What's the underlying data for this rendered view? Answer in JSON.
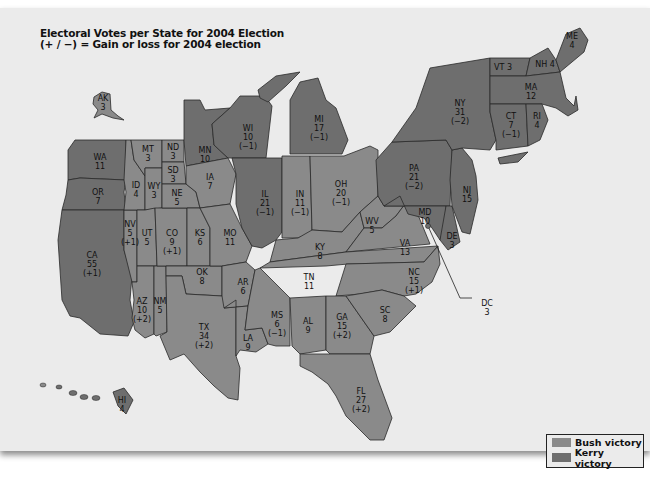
{
  "title": {
    "line1": "Electoral Votes per State for 2004 Election",
    "line2": "(+ / −) = Gain or loss for 2004 election"
  },
  "colors": {
    "bush": "#8a8a8a",
    "kerry": "#6e6e6e",
    "background": "#ebebeb"
  },
  "legend": {
    "items": [
      {
        "label": "Bush victory",
        "color": "#8a8a8a"
      },
      {
        "label": "Kerry victory",
        "color": "#6e6e6e"
      }
    ]
  },
  "states": {
    "AK": {
      "votes": "3",
      "change": "",
      "winner": "bush"
    },
    "HI": {
      "votes": "4",
      "change": "",
      "winner": "kerry"
    },
    "WA": {
      "votes": "11",
      "change": "",
      "winner": "kerry"
    },
    "OR": {
      "votes": "7",
      "change": "",
      "winner": "kerry"
    },
    "CA": {
      "votes": "55",
      "change": "(+1)",
      "winner": "kerry"
    },
    "NV": {
      "votes": "5",
      "change": "(+1)",
      "winner": "bush"
    },
    "ID": {
      "votes": "4",
      "change": "",
      "winner": "bush"
    },
    "MT": {
      "votes": "3",
      "change": "",
      "winner": "bush"
    },
    "WY": {
      "votes": "3",
      "change": "",
      "winner": "bush"
    },
    "UT": {
      "votes": "5",
      "change": "",
      "winner": "bush"
    },
    "AZ": {
      "votes": "10",
      "change": "(+2)",
      "winner": "bush"
    },
    "NM": {
      "votes": "5",
      "change": "",
      "winner": "bush"
    },
    "CO": {
      "votes": "9",
      "change": "(+1)",
      "winner": "bush"
    },
    "ND": {
      "votes": "3",
      "change": "",
      "winner": "bush"
    },
    "SD": {
      "votes": "3",
      "change": "",
      "winner": "bush"
    },
    "NE": {
      "votes": "5",
      "change": "",
      "winner": "bush"
    },
    "KS": {
      "votes": "6",
      "change": "",
      "winner": "bush"
    },
    "OK": {
      "votes": "8",
      "change": "",
      "winner": "bush"
    },
    "TX": {
      "votes": "34",
      "change": "(+2)",
      "winner": "bush"
    },
    "MN": {
      "votes": "10",
      "change": "",
      "winner": "kerry"
    },
    "IA": {
      "votes": "7",
      "change": "",
      "winner": "bush"
    },
    "MO": {
      "votes": "11",
      "change": "",
      "winner": "bush"
    },
    "AR": {
      "votes": "6",
      "change": "",
      "winner": "bush"
    },
    "LA": {
      "votes": "9",
      "change": "",
      "winner": "bush"
    },
    "WI": {
      "votes": "10",
      "change": "(−1)",
      "winner": "kerry"
    },
    "IL": {
      "votes": "21",
      "change": "(−1)",
      "winner": "kerry"
    },
    "MI": {
      "votes": "17",
      "change": "(−1)",
      "winner": "kerry"
    },
    "IN": {
      "votes": "11",
      "change": "(−1)",
      "winner": "bush"
    },
    "OH": {
      "votes": "20",
      "change": "(−1)",
      "winner": "bush"
    },
    "KY": {
      "votes": "8",
      "change": "",
      "winner": "bush"
    },
    "TN": {
      "votes": "11",
      "change": "",
      "winner": "bush"
    },
    "MS": {
      "votes": "6",
      "change": "(−1)",
      "winner": "bush"
    },
    "AL": {
      "votes": "9",
      "change": "",
      "winner": "bush"
    },
    "GA": {
      "votes": "15",
      "change": "(+2)",
      "winner": "bush"
    },
    "FL": {
      "votes": "27",
      "change": "(+2)",
      "winner": "bush"
    },
    "SC": {
      "votes": "8",
      "change": "",
      "winner": "bush"
    },
    "NC": {
      "votes": "15",
      "change": "(+1)",
      "winner": "bush"
    },
    "VA": {
      "votes": "13",
      "change": "",
      "winner": "bush"
    },
    "WV": {
      "votes": "5",
      "change": "",
      "winner": "bush"
    },
    "PA": {
      "votes": "21",
      "change": "(−2)",
      "winner": "kerry"
    },
    "MD": {
      "votes": "10",
      "change": "",
      "winner": "kerry"
    },
    "DE": {
      "votes": "3",
      "change": "",
      "winner": "kerry"
    },
    "DC": {
      "votes": "3",
      "change": "",
      "winner": "kerry"
    },
    "NJ": {
      "votes": "15",
      "change": "",
      "winner": "kerry"
    },
    "NY": {
      "votes": "31",
      "change": "(−2)",
      "winner": "kerry"
    },
    "CT": {
      "votes": "7",
      "change": "(−1)",
      "winner": "kerry"
    },
    "RI": {
      "votes": "4",
      "change": "",
      "winner": "kerry"
    },
    "MA": {
      "votes": "12",
      "change": "",
      "winner": "kerry"
    },
    "VT": {
      "votes": "3",
      "change": "",
      "winner": "kerry"
    },
    "NH": {
      "votes": "4",
      "change": "",
      "winner": "kerry"
    },
    "ME": {
      "votes": "4",
      "change": "",
      "winner": "kerry"
    }
  }
}
